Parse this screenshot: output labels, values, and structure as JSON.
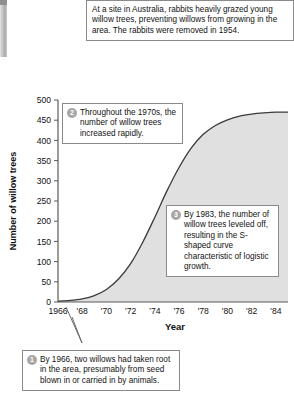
{
  "figure": {
    "intro_note": "At a site in Australia, rabbits heavily grazed young willow trees, preventing willows from growing in the area. The rabbits were removed in 1954.",
    "callouts": [
      {
        "number": "1",
        "text": "By 1966, two willows had taken root in the area, presumably from seed blown in or carried in by animals."
      },
      {
        "number": "2",
        "text": "Throughout the 1970s, the number of willow trees increased rapidly."
      },
      {
        "number": "3",
        "text": "By 1983, the number of willow trees leveled off, resulting in the S-shaped curve characteristic of logistic growth."
      }
    ]
  },
  "chart_data": {
    "type": "line",
    "title": "",
    "xlabel": "Year",
    "ylabel": "Number of willow trees",
    "xlim": [
      1966,
      1985
    ],
    "ylim": [
      0,
      500
    ],
    "grid": false,
    "legend": "none",
    "area_fill": true,
    "xtick_labels": [
      "1966",
      "'68",
      "'70",
      "'72",
      "'74",
      "'76",
      "'78",
      "'80",
      "'82",
      "'84"
    ],
    "xtick_values": [
      1966,
      1968,
      1970,
      1972,
      1974,
      1976,
      1978,
      1980,
      1982,
      1984
    ],
    "ytick_labels": [
      "0",
      "50",
      "100",
      "150",
      "200",
      "250",
      "300",
      "350",
      "400",
      "450",
      "500"
    ],
    "ytick_values": [
      0,
      50,
      100,
      150,
      200,
      250,
      300,
      350,
      400,
      450,
      500
    ],
    "series": [
      {
        "name": "Willow trees",
        "x": [
          1966,
          1967,
          1968,
          1969,
          1970,
          1971,
          1972,
          1973,
          1974,
          1975,
          1976,
          1977,
          1978,
          1979,
          1980,
          1981,
          1982,
          1983,
          1984,
          1985
        ],
        "values": [
          2,
          4,
          8,
          16,
          31,
          57,
          95,
          148,
          210,
          275,
          333,
          381,
          415,
          437,
          451,
          460,
          465,
          468,
          470,
          470
        ]
      }
    ],
    "colors": {
      "curve": "#3a3a3a",
      "area": "#e0e0e0",
      "axis": "#5a5a5a",
      "badge": "#a6a6a6",
      "box_border": "#8a8a8a"
    }
  }
}
